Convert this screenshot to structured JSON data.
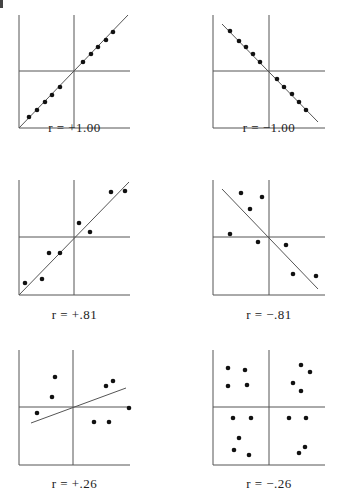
{
  "figure": {
    "corner_mark": "|",
    "panels": [
      {
        "id": "p1",
        "label": "r = +1.00"
      },
      {
        "id": "p2",
        "label": "r = −1.00"
      },
      {
        "id": "p3",
        "label": "r = +.81"
      },
      {
        "id": "p4",
        "label": "r = −.81"
      },
      {
        "id": "p5",
        "label": "r = +.26"
      },
      {
        "id": "p6",
        "label": "r = −.26"
      }
    ]
  },
  "chart_data": [
    {
      "type": "scatter",
      "title": "r = +1.00",
      "r": 1.0,
      "box": [
        19,
        15,
        130,
        128
      ],
      "cross": [
        74,
        71
      ],
      "fit_line": [
        [
          19,
          128
        ],
        [
          128,
          15
        ]
      ],
      "points": [
        [
          29,
          117
        ],
        [
          37,
          110
        ],
        [
          45,
          102
        ],
        [
          52,
          95
        ],
        [
          60,
          87
        ],
        [
          83,
          62
        ],
        [
          91,
          54
        ],
        [
          98,
          47
        ],
        [
          106,
          40
        ],
        [
          113,
          32
        ]
      ],
      "xlabel": "",
      "ylabel": "",
      "grid": false
    },
    {
      "type": "scatter",
      "title": "r = −1.00",
      "r": -1.0,
      "box": [
        213,
        15,
        325,
        128
      ],
      "cross": [
        269,
        71
      ],
      "fit_line": [
        [
          222,
          24
        ],
        [
          318,
          122
        ]
      ],
      "points": [
        [
          230,
          31
        ],
        [
          239,
          41
        ],
        [
          246,
          47
        ],
        [
          253,
          54
        ],
        [
          260,
          62
        ],
        [
          277,
          79
        ],
        [
          284,
          87
        ],
        [
          292,
          94
        ],
        [
          299,
          102
        ],
        [
          306,
          110
        ]
      ],
      "xlabel": "",
      "ylabel": "",
      "grid": false
    },
    {
      "type": "scatter",
      "title": "r = +.81",
      "r": 0.81,
      "box": [
        19,
        180,
        130,
        295
      ],
      "cross": [
        74,
        237
      ],
      "fit_line": [
        [
          19,
          295
        ],
        [
          129,
          182
        ]
      ],
      "points": [
        [
          25,
          283
        ],
        [
          42,
          279
        ],
        [
          49,
          253
        ],
        [
          60,
          253
        ],
        [
          79,
          223
        ],
        [
          90,
          232
        ],
        [
          111,
          192
        ],
        [
          125,
          191
        ]
      ],
      "xlabel": "",
      "ylabel": "",
      "grid": false
    },
    {
      "type": "scatter",
      "title": "r = −.81",
      "r": -0.81,
      "box": [
        213,
        180,
        325,
        295
      ],
      "cross": [
        269,
        237
      ],
      "fit_line": [
        [
          222,
          189
        ],
        [
          318,
          289
        ]
      ],
      "points": [
        [
          241,
          193
        ],
        [
          262,
          197
        ],
        [
          250,
          209
        ],
        [
          230,
          234
        ],
        [
          258,
          242
        ],
        [
          286,
          245
        ],
        [
          293,
          274
        ],
        [
          316,
          276
        ]
      ],
      "xlabel": "",
      "ylabel": "",
      "grid": false
    },
    {
      "type": "scatter",
      "title": "r = +.26",
      "r": 0.26,
      "box": [
        19,
        350,
        130,
        465
      ],
      "cross": [
        73,
        407
      ],
      "fit_line": [
        [
          31,
          423
        ],
        [
          126,
          388
        ]
      ],
      "points": [
        [
          55,
          377
        ],
        [
          52,
          397
        ],
        [
          37,
          413
        ],
        [
          106,
          386
        ],
        [
          113,
          381
        ],
        [
          129,
          408
        ],
        [
          94,
          422
        ],
        [
          109,
          422
        ]
      ],
      "xlabel": "",
      "ylabel": "",
      "grid": false
    },
    {
      "type": "scatter",
      "title": "r = −.26",
      "r": -0.26,
      "box": [
        213,
        350,
        325,
        465
      ],
      "cross": [
        269,
        407
      ],
      "fit_line": null,
      "points": [
        [
          228,
          368
        ],
        [
          245,
          370
        ],
        [
          228,
          386
        ],
        [
          247,
          385
        ],
        [
          301,
          365
        ],
        [
          310,
          372
        ],
        [
          293,
          383
        ],
        [
          301,
          391
        ],
        [
          233,
          418
        ],
        [
          251,
          418
        ],
        [
          289,
          418
        ],
        [
          306,
          418
        ],
        [
          239,
          438
        ],
        [
          234,
          450
        ],
        [
          249,
          455
        ],
        [
          305,
          447
        ],
        [
          299,
          453
        ]
      ],
      "xlabel": "",
      "ylabel": "",
      "grid": false
    }
  ]
}
